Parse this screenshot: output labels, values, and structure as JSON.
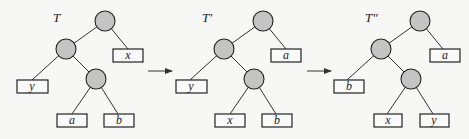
{
  "diagram": {
    "trees": [
      {
        "title": "T",
        "leaves": {
          "right_of_root": "x",
          "left_of_child": "y",
          "inner_left": "a",
          "inner_right": "b"
        }
      },
      {
        "title": "T′",
        "leaves": {
          "right_of_root": "a",
          "left_of_child": "y",
          "inner_left": "x",
          "inner_right": "b"
        }
      },
      {
        "title": "T″",
        "leaves": {
          "right_of_root": "a",
          "left_of_child": "b",
          "inner_left": "x",
          "inner_right": "y"
        }
      }
    ],
    "arrows": [
      "→",
      "→"
    ],
    "colors": {
      "internal_node": "#c4c4c4",
      "leaf_box": "#fafafa",
      "stroke": "#222222"
    }
  }
}
